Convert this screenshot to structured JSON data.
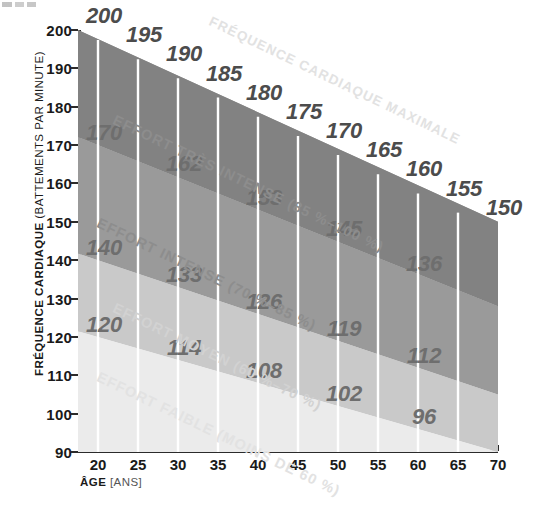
{
  "chart_data": {
    "type": "area",
    "title": "",
    "xlabel": "ÂGE",
    "xlabel_unit": "(ANS)",
    "ylabel": "FRÉQUENCE CARDIAQUE",
    "ylabel_unit": "(BATTEMENTS PAR MINUTE)",
    "xlim": [
      17.5,
      70
    ],
    "ylim": [
      90,
      200
    ],
    "xticks": [
      20,
      25,
      30,
      35,
      40,
      45,
      50,
      55,
      60,
      65,
      70
    ],
    "yticks": [
      90,
      100,
      110,
      120,
      130,
      140,
      150,
      160,
      170,
      180,
      190,
      200
    ],
    "grid": false,
    "legend": "none",
    "ages": [
      20,
      25,
      30,
      35,
      40,
      45,
      50,
      55,
      60,
      65,
      70
    ],
    "series": [
      {
        "name": "Fréquence cardiaque maximale",
        "label": "FRÉQUENCE CARDIAQUE MAXIMALE",
        "percent": "100 %",
        "values": [
          200,
          195,
          190,
          185,
          180,
          175,
          170,
          165,
          160,
          155,
          150
        ]
      },
      {
        "name": "Effort très intense",
        "label": "EFFORT TRÈS INTENSE",
        "range": "(85 %–100 %)",
        "boundary_label": "85 %",
        "values": [
          170,
          166,
          162,
          157,
          153,
          149,
          145,
          140,
          136,
          132,
          128
        ]
      },
      {
        "name": "Effort intense",
        "label": "EFFORT INTENSE",
        "range": "(70 %–85 %)",
        "boundary_label": "70 %",
        "values": [
          140,
          137,
          133,
          130,
          126,
          123,
          119,
          116,
          112,
          109,
          105
        ]
      },
      {
        "name": "Effort moyen",
        "label": "EFFORT MOYEN",
        "range": "(60 %–70 %)",
        "boundary_label": "60 %",
        "values": [
          120,
          117,
          114,
          111,
          108,
          105,
          102,
          99,
          96,
          93,
          90
        ]
      },
      {
        "name": "Effort faible",
        "label": "EFFORT FAIBLE",
        "range": "(MOINS DE 60 %)",
        "values": []
      }
    ],
    "value_labels": {
      "max": [
        200,
        195,
        190,
        185,
        180,
        175,
        170,
        165,
        160,
        155,
        150
      ],
      "tres_intense": [
        170,
        162,
        153,
        145,
        136
      ],
      "intense": [
        140,
        133,
        126,
        119,
        112
      ],
      "moyen": [
        120,
        114,
        108,
        102,
        96
      ]
    },
    "colors": {
      "zone_max": "#828282",
      "zone_tres_intense": "#9a9a9a",
      "zone_intense": "#c9c9c9",
      "zone_moyen": "#ebebeb",
      "zone_faible": "#ffffff",
      "axis": "#2b2b2b",
      "grid_line": "#ffffff",
      "value_text": "#4c4c4c",
      "background": "#ffffff"
    }
  },
  "axis": {
    "y_title_main": "FRÉQUENCE CARDIAQUE",
    "y_title_unit": "(BATTEMENTS PAR MINUTE)",
    "x_title_main": "ÂGE",
    "x_title_unit": "[ANS]"
  },
  "captions": {
    "max_line": "FRÉQUENCE CARDIAQUE MAXIMALE",
    "tres_intense": "EFFORT TRÈS INTENSE (85 %–100 %)",
    "intense": "EFFORT INTENSE (70 %–85 %)",
    "moyen": "EFFORT MOYEN (60 %–70 %)",
    "faible": "EFFORT FAIBLE (MOINS DE 60 %)"
  },
  "ticks": {
    "y": [
      "200",
      "190",
      "180",
      "170",
      "160",
      "150",
      "140",
      "130",
      "120",
      "110",
      "100",
      "90"
    ],
    "x": [
      "20",
      "25",
      "30",
      "35",
      "40",
      "45",
      "50",
      "55",
      "60",
      "65",
      "70"
    ]
  }
}
